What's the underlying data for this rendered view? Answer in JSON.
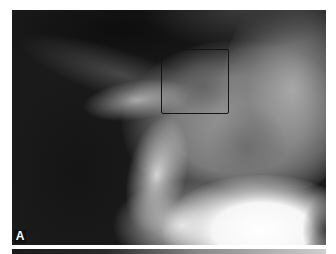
{
  "figure": {
    "type": "radiograph",
    "panel_label": "A",
    "annotation": {
      "shape": "rectangle",
      "color": "#141414",
      "description": "region of interest box"
    },
    "colors": {
      "background": "#ffffff",
      "dark_soft_tissue": "#1a1a1a",
      "bone_bright": "#ffffff"
    }
  }
}
